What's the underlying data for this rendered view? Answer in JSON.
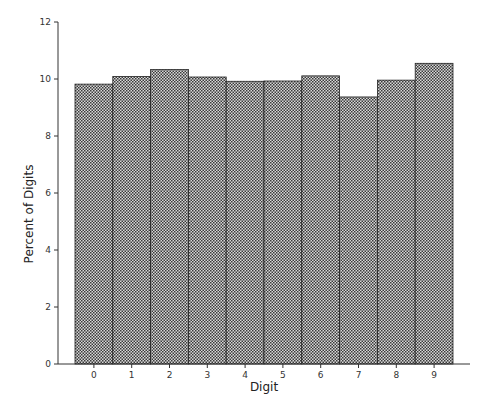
{
  "chart_data": {
    "type": "bar",
    "title": "",
    "xlabel": "Digit",
    "ylabel": "Percent of Digits",
    "categories": [
      "0",
      "1",
      "2",
      "3",
      "4",
      "5",
      "6",
      "7",
      "8",
      "9"
    ],
    "values": [
      9.82,
      10.09,
      10.33,
      10.07,
      9.92,
      9.93,
      10.11,
      9.37,
      9.96,
      10.55
    ],
    "ylim": [
      0,
      12
    ],
    "yticks": [
      0,
      2,
      4,
      6,
      8,
      10,
      12
    ],
    "grid": false,
    "legend": null,
    "bar_fill": "crosshatch",
    "bar_color": "#555555"
  }
}
